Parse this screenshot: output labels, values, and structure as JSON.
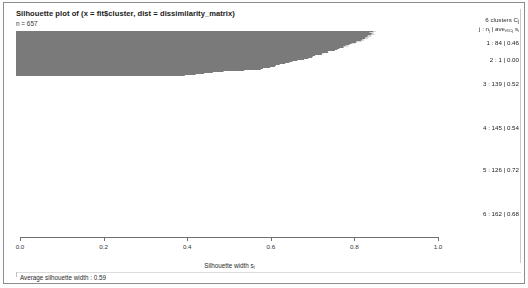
{
  "window": {
    "title": "Silhouette plot of (x = fit$cluster, dist = dissimilarity_matrix)",
    "subtitle": "n = 657"
  },
  "legend": {
    "header_line1": "6 clusters C",
    "header_line1_sub": "j",
    "header_line2": "j :  n",
    "header_line2_sub": "j",
    "header_line2_tail": " | ave",
    "header_line2_sub2": "i∈Cj",
    "header_line2_tail2": " s",
    "header_line2_sub3": "i",
    "rows": [
      {
        "label": "1 :  84  |  0.46"
      },
      {
        "label": "2 :    1  |  0.00"
      },
      {
        "label": "3 :  139  |  0.52"
      },
      {
        "label": "4 :  145  |  0.54"
      },
      {
        "label": "5 :  126  |  0.72"
      },
      {
        "label": "6 :  162  |  0.68"
      }
    ]
  },
  "axis": {
    "label": "Silhouette width s",
    "label_sub": "i",
    "ticks": [
      "0.0",
      "0.2",
      "0.4",
      "0.6",
      "0.8",
      "1.0"
    ],
    "tick_values": [
      0.0,
      0.2,
      0.4,
      0.6,
      0.8,
      1.0
    ]
  },
  "footer": {
    "text": "Average silhouette width :  0.59"
  },
  "chart_data": {
    "type": "bar",
    "title": "Silhouette plot of (x = fit$cluster, dist = dissimilarity_matrix)",
    "subtitle": "n = 657",
    "xlabel": "Silhouette width s_i",
    "ylabel": "",
    "xlim": [
      0.0,
      1.0
    ],
    "grid": false,
    "legend_position": "right",
    "orientation": "horizontal",
    "n_total": 657,
    "average_silhouette_width": 0.59,
    "n_clusters": 6,
    "categories": [
      "1",
      "2",
      "3",
      "4",
      "5",
      "6"
    ],
    "series": [
      {
        "name": "cluster size n_j",
        "values": [
          84,
          1,
          139,
          145,
          126,
          162
        ]
      },
      {
        "name": "average silhouette width per cluster",
        "values": [
          0.46,
          0.0,
          0.52,
          0.54,
          0.72,
          0.68
        ]
      }
    ],
    "clusters": [
      {
        "id": 1,
        "size": 84,
        "avg_silhouette": 0.46,
        "color": "#0a0a0a",
        "s_max": 0.8,
        "s_min": 0.17
      },
      {
        "id": 2,
        "size": 1,
        "avg_silhouette": 0.0,
        "color": "#3d3d3d",
        "s_max": 0.02,
        "s_min": 0.0
      },
      {
        "id": 3,
        "size": 139,
        "avg_silhouette": 0.52,
        "color": "#b3b3b3",
        "s_max": 0.8,
        "s_min": 0.4
      },
      {
        "id": 4,
        "size": 145,
        "avg_silhouette": 0.54,
        "color": "#6b6b6b",
        "s_max": 0.81,
        "s_min": 0.42
      },
      {
        "id": 5,
        "size": 126,
        "avg_silhouette": 0.72,
        "color": "#d6d6d6",
        "s_max": 0.85,
        "s_min": 0.52
      },
      {
        "id": 6,
        "size": 162,
        "avg_silhouette": 0.68,
        "color": "#7a7a7a",
        "s_max": 0.84,
        "s_min": 0.4
      }
    ]
  }
}
